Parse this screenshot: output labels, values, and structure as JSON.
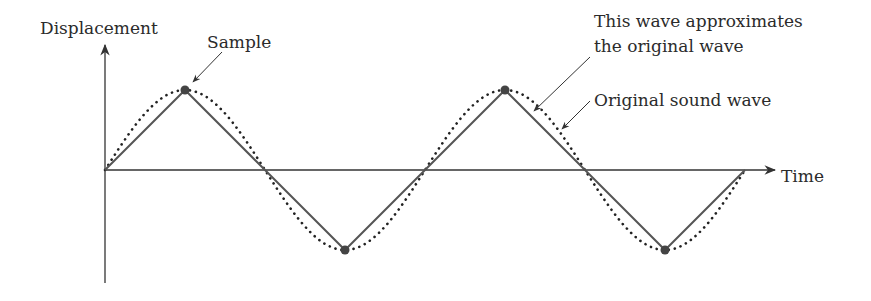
{
  "diagram": {
    "labels": {
      "y_axis": "Displacement",
      "x_axis": "Time",
      "sample": "Sample",
      "approx_line1": "This wave approximates",
      "approx_line2": "the original wave",
      "original": "Original sound wave"
    },
    "colors": {
      "axis": "#333333",
      "approx_wave": "#555555",
      "original_wave": "#222222",
      "sample_point": "#444444",
      "text": "#2b2b2b"
    },
    "geometry": {
      "origin": [
        105,
        170
      ],
      "y_axis_top": 45,
      "y_axis_bottom": 283,
      "x_axis_end": 775,
      "amplitude": 80,
      "period": 320,
      "cycles": 2
    },
    "samples": [
      {
        "x": 105,
        "y": 170
      },
      {
        "x": 185,
        "y": 90
      },
      {
        "x": 265,
        "y": 170
      },
      {
        "x": 345,
        "y": 250
      },
      {
        "x": 425,
        "y": 170
      },
      {
        "x": 505,
        "y": 90
      },
      {
        "x": 585,
        "y": 170
      },
      {
        "x": 665,
        "y": 250
      },
      {
        "x": 745,
        "y": 170
      }
    ],
    "sample_markers": [
      {
        "x": 185,
        "y": 90
      },
      {
        "x": 505,
        "y": 90
      },
      {
        "x": 345,
        "y": 250
      },
      {
        "x": 665,
        "y": 250
      }
    ]
  }
}
